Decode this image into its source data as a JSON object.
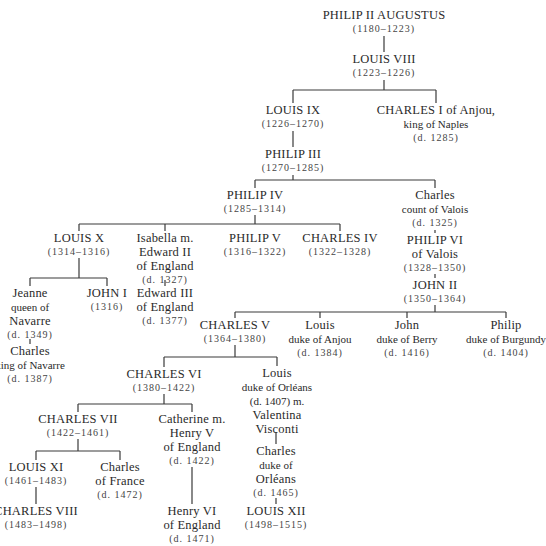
{
  "nodes": [
    {
      "id": "philip2",
      "lines": [
        "PHILIP II AUGUSTUS"
      ],
      "dates": "(1180–1223)",
      "x": 384,
      "y": 8
    },
    {
      "id": "louis8",
      "lines": [
        "LOUIS VIII"
      ],
      "dates": "(1223–1226)",
      "x": 384,
      "y": 52
    },
    {
      "id": "louis9",
      "lines": [
        "LOUIS IX"
      ],
      "dates": "(1226–1270)",
      "x": 293,
      "y": 103
    },
    {
      "id": "charles1",
      "lines": [
        "CHARLES I of Anjou,",
        "king of Naples"
      ],
      "dates": "(d. 1285)",
      "x": 436,
      "y": 103
    },
    {
      "id": "philip3",
      "lines": [
        "PHILIP III"
      ],
      "dates": "(1270–1285)",
      "x": 293,
      "y": 147
    },
    {
      "id": "philip4",
      "lines": [
        "PHILIP IV"
      ],
      "dates": "(1285–1314)",
      "x": 255,
      "y": 188
    },
    {
      "id": "charlesv",
      "lines": [
        "Charles",
        "count of Valois"
      ],
      "dates": "(d. 1325)",
      "x": 435,
      "y": 188
    },
    {
      "id": "louis10",
      "lines": [
        "LOUIS X"
      ],
      "dates": "(1314–1316)",
      "x": 79,
      "y": 231
    },
    {
      "id": "isabella",
      "lines": [
        "Isabella m.",
        "Edward II",
        "of England"
      ],
      "dates": "(d. 1327)",
      "x": 165,
      "y": 231
    },
    {
      "id": "philip5",
      "lines": [
        "PHILIP V"
      ],
      "dates": "(1316–1322)",
      "x": 255,
      "y": 231
    },
    {
      "id": "charles4",
      "lines": [
        "CHARLES IV"
      ],
      "dates": "(1322–1328)",
      "x": 340,
      "y": 231
    },
    {
      "id": "philip6",
      "lines": [
        "PHILIP VI",
        "of Valois"
      ],
      "dates": "(1328–1350)",
      "x": 435,
      "y": 233
    },
    {
      "id": "john2",
      "lines": [
        "JOHN II"
      ],
      "dates": "(1350–1364)",
      "x": 435,
      "y": 278
    },
    {
      "id": "jeanne",
      "lines": [
        "Jeanne",
        "queen of",
        "Navarre"
      ],
      "dates": "(d. 1349)",
      "x": 30,
      "y": 286
    },
    {
      "id": "john1",
      "lines": [
        "JOHN I"
      ],
      "dates": "(1316)",
      "x": 107,
      "y": 286
    },
    {
      "id": "edward3",
      "lines": [
        "Edward III",
        "of England"
      ],
      "dates": "(d. 1377)",
      "x": 165,
      "y": 286
    },
    {
      "id": "charlesnav",
      "lines": [
        "Charles",
        "king of Navarre"
      ],
      "dates": "(d. 1387)",
      "x": 30,
      "y": 344
    },
    {
      "id": "charles5",
      "lines": [
        "CHARLES V"
      ],
      "dates": "(1364–1380)",
      "x": 235,
      "y": 318
    },
    {
      "id": "louisanjou",
      "lines": [
        "Louis",
        "duke of Anjou"
      ],
      "dates": "(d. 1384)",
      "x": 320,
      "y": 318
    },
    {
      "id": "johnberry",
      "lines": [
        "John",
        "duke of Berry"
      ],
      "dates": "(d. 1416)",
      "x": 407,
      "y": 318
    },
    {
      "id": "philipburg",
      "lines": [
        "Philip",
        "duke of Burgundy"
      ],
      "dates": "(d. 1404)",
      "x": 506,
      "y": 318
    },
    {
      "id": "charles6",
      "lines": [
        "CHARLES VI"
      ],
      "dates": "(1380–1422)",
      "x": 164,
      "y": 367
    },
    {
      "id": "louisorl",
      "lines": [
        "Louis",
        "duke of Orléans",
        "(d. 1407) m.",
        "Valentina",
        "Visconti"
      ],
      "dates": "",
      "x": 277,
      "y": 366
    },
    {
      "id": "charles7",
      "lines": [
        "CHARLES VII"
      ],
      "dates": "(1422–1461)",
      "x": 78,
      "y": 412
    },
    {
      "id": "catherine",
      "lines": [
        "Catherine m.",
        "Henry V",
        "of England"
      ],
      "dates": "(d. 1422)",
      "x": 192,
      "y": 412
    },
    {
      "id": "charlesorl",
      "lines": [
        "Charles",
        "duke of",
        "Orléans"
      ],
      "dates": "(d. 1465)",
      "x": 276,
      "y": 444
    },
    {
      "id": "louis11",
      "lines": [
        "LOUIS XI"
      ],
      "dates": "(1461–1483)",
      "x": 36,
      "y": 460
    },
    {
      "id": "charlesfr",
      "lines": [
        "Charles",
        "of France"
      ],
      "dates": "(d. 1472)",
      "x": 120,
      "y": 460
    },
    {
      "id": "charles8",
      "lines": [
        "CHARLES VIII"
      ],
      "dates": "(1483–1498)",
      "x": 36,
      "y": 504
    },
    {
      "id": "henry6",
      "lines": [
        "Henry VI",
        "of England"
      ],
      "dates": "(d. 1471)",
      "x": 192,
      "y": 504
    },
    {
      "id": "louis12",
      "lines": [
        "LOUIS XII"
      ],
      "dates": "(1498–1515)",
      "x": 276,
      "y": 504
    }
  ],
  "connectors": [
    [
      384,
      36,
      384,
      52
    ],
    [
      384,
      80,
      384,
      90
    ],
    [
      293,
      90,
      436,
      90
    ],
    [
      293,
      90,
      293,
      103
    ],
    [
      436,
      90,
      436,
      103
    ],
    [
      293,
      131,
      293,
      147
    ],
    [
      293,
      175,
      293,
      180
    ],
    [
      255,
      180,
      435,
      180
    ],
    [
      255,
      180,
      255,
      188
    ],
    [
      435,
      180,
      435,
      188
    ],
    [
      255,
      215,
      255,
      224
    ],
    [
      79,
      224,
      340,
      224
    ],
    [
      79,
      224,
      79,
      231
    ],
    [
      165,
      224,
      165,
      231
    ],
    [
      340,
      224,
      340,
      231
    ],
    [
      435,
      230,
      435,
      233
    ],
    [
      435,
      274,
      435,
      278
    ],
    [
      79,
      258,
      79,
      278
    ],
    [
      30,
      278,
      107,
      278
    ],
    [
      30,
      278,
      30,
      286
    ],
    [
      107,
      278,
      107,
      286
    ],
    [
      165,
      286,
      165,
      280
    ],
    [
      30,
      339,
      30,
      344
    ],
    [
      435,
      305,
      435,
      312
    ],
    [
      235,
      312,
      506,
      312
    ],
    [
      235,
      312,
      235,
      318
    ],
    [
      320,
      312,
      320,
      318
    ],
    [
      407,
      312,
      407,
      318
    ],
    [
      506,
      312,
      506,
      318
    ],
    [
      235,
      345,
      235,
      357
    ],
    [
      164,
      357,
      277,
      357
    ],
    [
      164,
      357,
      164,
      367
    ],
    [
      277,
      357,
      277,
      366
    ],
    [
      164,
      394,
      164,
      404
    ],
    [
      78,
      404,
      192,
      404
    ],
    [
      78,
      404,
      78,
      412
    ],
    [
      192,
      404,
      192,
      412
    ],
    [
      276,
      432,
      276,
      444
    ],
    [
      78,
      439,
      78,
      451
    ],
    [
      36,
      451,
      120,
      451
    ],
    [
      36,
      451,
      36,
      460
    ],
    [
      120,
      451,
      120,
      460
    ],
    [
      36,
      487,
      36,
      504
    ],
    [
      192,
      467,
      192,
      504
    ],
    [
      276,
      498,
      276,
      504
    ]
  ]
}
